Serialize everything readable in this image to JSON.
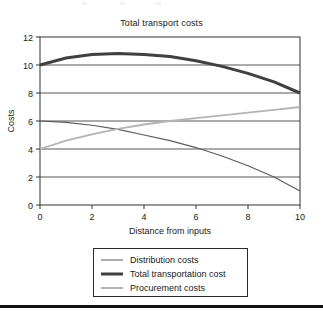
{
  "figure": {
    "title": "Total transport costs",
    "background": "#ffffff",
    "frame_color": "#333333",
    "gridline_color": "#444444",
    "text_color": "#1a1a1a",
    "bottom_rule_color": "#111111"
  },
  "legend": {
    "position": "below-plot",
    "border_color": "#2a2a2a",
    "entries": [
      {
        "label": "Distribution costs",
        "color": "#5a5a5a",
        "width": 1.1
      },
      {
        "label": "Total transportation cost",
        "color": "#404040",
        "width": 3.0
      },
      {
        "label": "Procurement costs",
        "color": "#b4b4b4",
        "width": 1.8
      }
    ]
  },
  "chart_data": {
    "type": "line",
    "title": "Total transport costs",
    "xlabel": "Distance from inputs",
    "ylabel": "Costs",
    "xlim": [
      0,
      10
    ],
    "ylim": [
      0,
      12
    ],
    "xticks": [
      0,
      2,
      4,
      6,
      8,
      10
    ],
    "yticks": [
      0,
      2,
      4,
      6,
      8,
      10,
      12
    ],
    "grid": "horizontal",
    "legend_position": "below",
    "x": [
      0,
      1,
      2,
      3,
      4,
      5,
      6,
      7,
      8,
      9,
      10
    ],
    "series": [
      {
        "name": "Distribution costs",
        "color": "#5a5a5a",
        "width": 1.1,
        "values": [
          6.0,
          5.9,
          5.7,
          5.4,
          5.0,
          4.6,
          4.1,
          3.5,
          2.8,
          2.0,
          1.0
        ]
      },
      {
        "name": "Total transportation cost",
        "color": "#404040",
        "width": 3.0,
        "values": [
          10.0,
          10.5,
          10.75,
          10.83,
          10.75,
          10.6,
          10.3,
          9.9,
          9.4,
          8.8,
          8.0
        ]
      },
      {
        "name": "Procurement costs",
        "color": "#b4b4b4",
        "width": 1.8,
        "values": [
          4.0,
          4.6,
          5.05,
          5.43,
          5.75,
          6.0,
          6.2,
          6.4,
          6.6,
          6.8,
          7.0
        ]
      }
    ]
  },
  "axes": {
    "x_tick_labels": [
      "0",
      "2",
      "4",
      "6",
      "8",
      "10"
    ],
    "y_tick_labels": [
      "0",
      "2",
      "4",
      "6",
      "8",
      "10",
      "12"
    ],
    "x_axis_title": "Distance from inputs",
    "y_axis_title": "Costs"
  }
}
